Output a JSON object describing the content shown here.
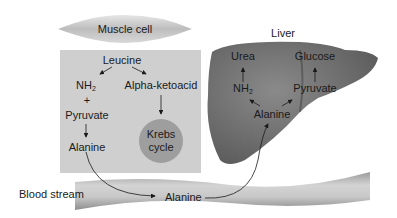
{
  "muscle": {
    "cell_label": "Muscle cell",
    "leucine": "Leucine",
    "nh2": "NH",
    "nh2_sub": "2",
    "plus": "+",
    "pyruvate": "Pyruvate",
    "alanine": "Alanine",
    "alpha_ketoacid": "Alpha-ketoacid",
    "krebs_line1": "Krebs",
    "krebs_line2": "cycle"
  },
  "liver": {
    "title": "Liver",
    "urea": "Urea",
    "glucose": "Glucose",
    "nh2": "NH",
    "nh2_sub": "2",
    "pyruvate": "Pyruvate",
    "alanine": "Alanine"
  },
  "blood": {
    "label": "Blood stream",
    "alanine": "Alanine"
  },
  "colors": {
    "muscle_box": "#cfcfcf",
    "krebs_circle": "#9e9e9e",
    "liver": "#6e6e6e",
    "vessel": "#b8b8b8"
  }
}
